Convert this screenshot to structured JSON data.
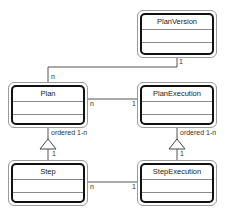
{
  "diagram": {
    "type": "uml-class-diagram",
    "classes": [
      {
        "id": "planversion",
        "name": "PlanVersion"
      },
      {
        "id": "plan",
        "name": "Plan"
      },
      {
        "id": "planexecution",
        "name": "PlanExecution"
      },
      {
        "id": "step",
        "name": "Step"
      },
      {
        "id": "stepexecution",
        "name": "StepExecution"
      }
    ],
    "associations": [
      {
        "from": "PlanVersion",
        "to": "Plan",
        "from_mult": "1",
        "to_mult": "n"
      },
      {
        "from": "Plan",
        "to": "PlanExecution",
        "from_mult": "n",
        "to_mult": "1"
      },
      {
        "from": "Step",
        "to": "StepExecution",
        "from_mult": "n",
        "to_mult": "1"
      }
    ],
    "aggregations": [
      {
        "whole": "Plan",
        "part": "Step",
        "label": "ordered 1-n",
        "part_mult": "1"
      },
      {
        "whole": "PlanExecution",
        "part": "StepExecution",
        "label": "ordered 1-n",
        "part_mult": "1"
      }
    ]
  },
  "labels": {
    "pv_plan_1": "1",
    "pv_plan_n": "n",
    "plan_pe_n": "n",
    "plan_pe_1": "1",
    "plan_step_ordered": "ordered 1-n",
    "plan_step_1": "1",
    "pe_se_ordered": "ordered 1-n",
    "pe_se_1": "1",
    "step_se_n": "n",
    "step_se_1": "1"
  }
}
